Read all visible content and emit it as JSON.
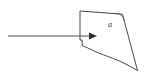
{
  "figure": {
    "type": "line-diagram",
    "background_color": "#ffffff",
    "stroke_color": "#4a4a4a",
    "arrow_color": "#2e2e2e",
    "canvas": {
      "width": 146,
      "height": 74
    },
    "labels": {
      "angle": "a"
    },
    "elements": {
      "arrow_line": {
        "name": "incoming-arrow",
        "start": [
          8,
          36
        ],
        "end": [
          96,
          36
        ],
        "head_at": [
          96,
          36
        ],
        "direction": "right"
      },
      "region_outline": {
        "name": "closed-region",
        "description": "irregular quadrilateral-like region with notched left side and wavy bottom edge",
        "vertices": [
          [
            80,
            11
          ],
          [
            122,
            14
          ],
          [
            137,
            70
          ],
          [
            112,
            58
          ],
          [
            92,
            50
          ],
          [
            82,
            45
          ],
          [
            80,
            11
          ]
        ]
      },
      "angle_arc": {
        "name": "angle-arc",
        "center": [
          122,
          14
        ],
        "radius": 9
      },
      "angle_label_position": [
        110,
        25
      ]
    }
  }
}
